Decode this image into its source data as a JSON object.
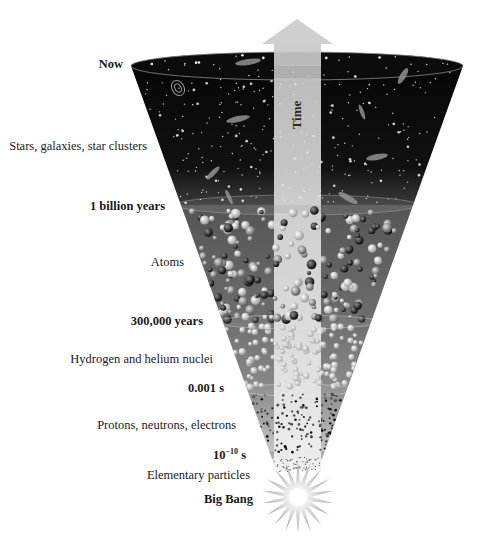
{
  "diagram": {
    "arrow_label": "Time",
    "colors": {
      "stars_band": "#050505",
      "atoms_band": "#6a6a6a",
      "nuclei_band": "#7c7c7c",
      "protons_band": "#9a9a9a",
      "elementary_band": "#e8e8e8",
      "arrow": "#cfcfcf",
      "background": "#ffffff"
    },
    "epochs": [
      {
        "label": "Now"
      },
      {
        "label": "1 billion years"
      },
      {
        "label": "300,000 years"
      },
      {
        "label": "0.001 s"
      },
      {
        "label_base": "10",
        "label_exp": "−10",
        "label_unit": " s"
      },
      {
        "label": "Big Bang"
      }
    ],
    "eras": [
      {
        "label": "Stars, galaxies, star clusters",
        "between": [
          "Now",
          "1 billion years"
        ]
      },
      {
        "label": "Atoms",
        "between": [
          "1 billion years",
          "300,000 years"
        ]
      },
      {
        "label": "Hydrogen and helium nuclei",
        "between": [
          "300,000 years",
          "0.001 s"
        ]
      },
      {
        "label": "Protons, neutrons, electrons",
        "between": [
          "0.001 s",
          "10^-10 s"
        ]
      },
      {
        "label": "Elementary particles",
        "between": [
          "10^-10 s",
          "Big Bang"
        ]
      }
    ]
  }
}
